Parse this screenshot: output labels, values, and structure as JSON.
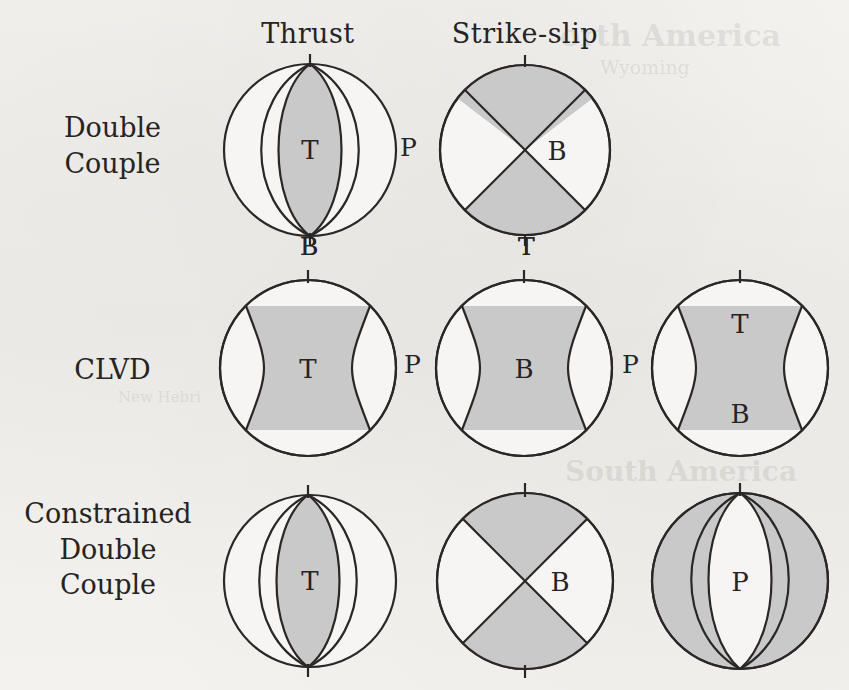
{
  "figure": {
    "title_columns": [
      "Thrust",
      "Strike-slip"
    ],
    "row_labels": [
      {
        "lines": [
          "Double",
          "Couple"
        ]
      },
      {
        "lines": [
          "CLVD"
        ]
      },
      {
        "lines": [
          "Constrained",
          "Double",
          "Couple"
        ]
      }
    ],
    "colors": {
      "page_background": "#f2f1ee",
      "shaded_quadrant": "#c9c9c9",
      "unshaded_quadrant": "#f6f5f3",
      "outline": "#2a2726",
      "text": "#262323"
    }
  },
  "headers": {
    "thrust": "Thrust",
    "strike_slip": "Strike-slip"
  },
  "rows": {
    "double_couple": {
      "label_line1": "Double",
      "label_line2": "Couple"
    },
    "clvd": {
      "label": "CLVD"
    },
    "constrained_double_couple": {
      "label_line1": "Constrained",
      "label_line2": "Double",
      "label_line3": "Couple"
    }
  },
  "beachballs": [
    {
      "id": "dc-thrust",
      "row": "Double Couple",
      "column": "Thrust",
      "type": "lens-shaded",
      "center_label": "T",
      "tick_top": true,
      "tick_bottom": true,
      "below_label": "B",
      "right_label": "P"
    },
    {
      "id": "dc-strikeslip",
      "row": "Double Couple",
      "column": "Strike-slip",
      "type": "cross-quadrants",
      "center_label": "B",
      "tick_top": true,
      "tick_bottom": true,
      "below_label": "T",
      "right_label": ""
    },
    {
      "id": "clvd-thrust",
      "row": "CLVD",
      "column": "Thrust",
      "type": "band-shaded",
      "center_label": "T",
      "tick_top": true,
      "tick_bottom": false,
      "below_label": "",
      "right_label": "P"
    },
    {
      "id": "clvd-strikeslip",
      "row": "CLVD",
      "column": "Strike-slip",
      "type": "band-shaded",
      "center_label": "B",
      "tick_top": true,
      "tick_bottom": false,
      "below_label": "",
      "right_label": "P"
    },
    {
      "id": "clvd-third",
      "row": "CLVD",
      "column": "",
      "type": "band-shaded-two-labels",
      "center_label_top": "T",
      "center_label_bottom": "B",
      "tick_top": true,
      "tick_bottom": false,
      "below_label": "",
      "right_label": ""
    },
    {
      "id": "cdc-thrust",
      "row": "Constrained Double Couple",
      "column": "Thrust",
      "type": "lens-shaded",
      "center_label": "T",
      "tick_top": true,
      "tick_bottom": true,
      "below_label": "",
      "right_label": ""
    },
    {
      "id": "cdc-strikeslip",
      "row": "Constrained Double Couple",
      "column": "Strike-slip",
      "type": "cross-quadrants",
      "center_label": "B",
      "tick_top": true,
      "tick_bottom": true,
      "below_label": "",
      "right_label": ""
    },
    {
      "id": "cdc-third",
      "row": "Constrained Double Couple",
      "column": "",
      "type": "lens-inverted",
      "center_label": "P",
      "tick_top": true,
      "tick_bottom": false,
      "below_label": "",
      "right_label": ""
    }
  ],
  "axis_labels": {
    "dc_thrust_right_P": "P",
    "dc_thrust_below_B": "B",
    "dc_strikeslip_below_T": "T",
    "clvd_thrust_right_P": "P",
    "clvd_strikeslip_right_P": "P"
  },
  "bleedthrough": {
    "line1": "orth America",
    "line2": "Wyoming",
    "line3": "South America",
    "line4": "New Hebri"
  }
}
